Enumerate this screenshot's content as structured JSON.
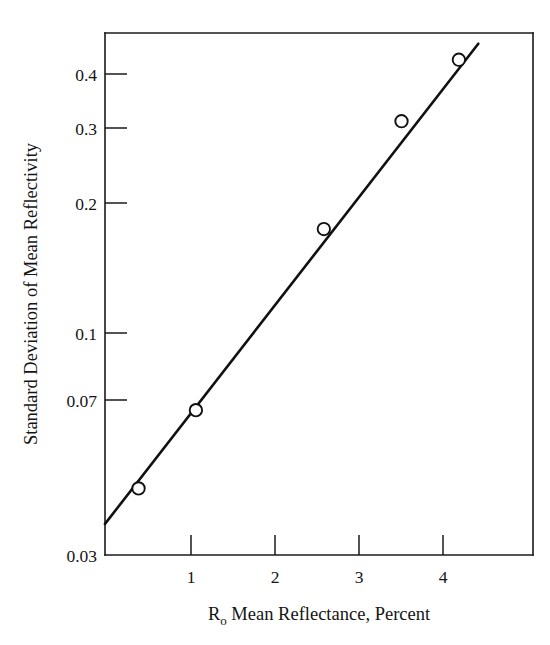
{
  "chart_data": {
    "type": "scatter",
    "title": "",
    "xlabel": "R₀ Mean Reflectance, Percent",
    "xlabel_main": "R",
    "xlabel_sub": "o",
    "xlabel_rest": " Mean Reflectance, Percent",
    "ylabel": "Standard Deviation of Mean Reflectivity",
    "xscale": "linear",
    "yscale": "log",
    "xlim": [
      0.0,
      4.85
    ],
    "ylim": [
      0.03,
      0.46
    ],
    "grid": false,
    "legend": false,
    "xticks": [
      1,
      2,
      3,
      4
    ],
    "xtick_labels": [
      "1",
      "2",
      "3",
      "4"
    ],
    "yticks": [
      0.03,
      0.07,
      0.1,
      0.2,
      0.3,
      0.4
    ],
    "ytick_labels": [
      "0.03",
      "0.07",
      "0.1",
      "0.2",
      "0.3",
      "0.4"
    ],
    "marker_style": "open-circle",
    "x": [
      0.38,
      1.03,
      2.48,
      3.36,
      4.01
    ],
    "y": [
      0.0425,
      0.064,
      0.165,
      0.29,
      0.4
    ],
    "series": [
      {
        "name": "measured points",
        "x": [
          0.38,
          1.03,
          2.48,
          3.36,
          4.01
        ],
        "values": [
          0.0425,
          0.064,
          0.165,
          0.29,
          0.4
        ]
      },
      {
        "name": "fitted line",
        "x": [
          0.0,
          4.23
        ],
        "values": [
          0.0353,
          0.435
        ]
      }
    ]
  }
}
